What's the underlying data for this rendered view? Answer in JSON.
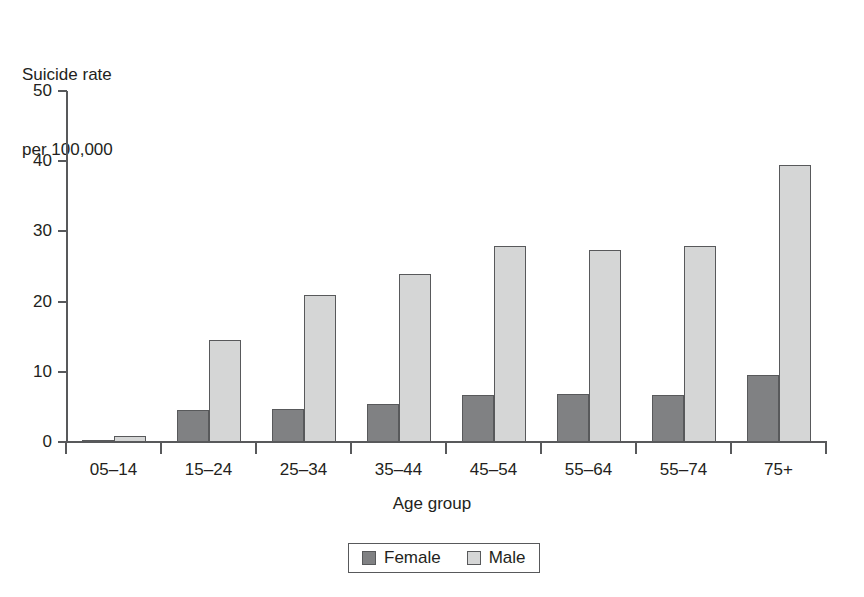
{
  "chart_data": {
    "type": "bar",
    "title": "",
    "subtitle": "",
    "ylabel_lines": [
      "Suicide rate",
      "per 100,000"
    ],
    "ylabel": "Suicide rate per 100,000",
    "xlabel": "Age group",
    "categories": [
      "05–14",
      "15–24",
      "25–34",
      "35–44",
      "45–54",
      "55–64",
      "55–74",
      "75+"
    ],
    "series": [
      {
        "name": "Female",
        "color": "#808183",
        "values": [
          0.3,
          4.5,
          4.7,
          5.4,
          6.7,
          6.9,
          6.7,
          9.6
        ]
      },
      {
        "name": "Male",
        "color": "#d5d6d6",
        "values": [
          0.8,
          14.5,
          21.0,
          23.9,
          27.9,
          27.3,
          27.9,
          39.5
        ]
      }
    ],
    "ylim": [
      0,
      50
    ],
    "yticks": [
      0,
      10,
      20,
      30,
      40,
      50
    ],
    "ytick_labels": [
      "0",
      "10",
      "20",
      "30",
      "40",
      "50"
    ],
    "grid": false,
    "legend_position": "bottom-center",
    "legend_entries": [
      "Female",
      "Male"
    ],
    "axis_color": "#58595b",
    "text_color": "#231f20",
    "background": "#ffffff"
  }
}
